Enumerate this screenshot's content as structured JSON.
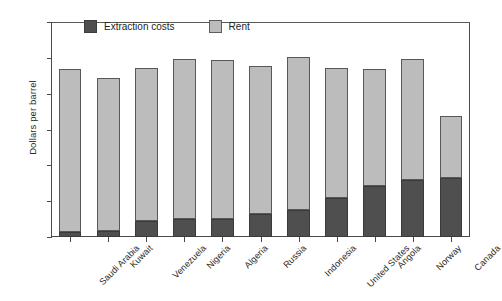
{
  "chart_data": {
    "type": "bar",
    "subtype": "stacked-vertical",
    "title": "",
    "xlabel": "",
    "ylabel": "Dollars per barrel",
    "ylim": [
      0,
      120
    ],
    "ytick_step": 20,
    "yticks": [
      0,
      20,
      40,
      60,
      80,
      100,
      120
    ],
    "ytick_labels": [
      "0",
      "20",
      "40",
      "60",
      "80",
      "100",
      "120"
    ],
    "grid": false,
    "legend_position": "top-inside",
    "categories": [
      "Saudi Arabia",
      "Kuwait",
      "Venezuela",
      "Nigeria",
      "Algeria",
      "Russia",
      "Indonesia",
      "United States",
      "Angola",
      "Norway",
      "Canada"
    ],
    "series": [
      {
        "name": "Extraction costs",
        "color": "#4f4f4f",
        "values": [
          3,
          3.5,
          9,
          10,
          10,
          13,
          15,
          22,
          28.5,
          32,
          33
        ]
      },
      {
        "name": "Rent",
        "color": "#bcbcbc",
        "values": [
          90,
          84.5,
          85,
          89,
          88,
          82,
          85,
          72,
          64.5,
          67,
          34
        ]
      }
    ],
    "totals": [
      93,
      88,
      94,
      99,
      98,
      95,
      100,
      94,
      93,
      99,
      67
    ]
  },
  "legend": {
    "items": [
      {
        "label": "Extraction costs",
        "swatch": "dark-square-swatch"
      },
      {
        "label": "Rent",
        "swatch": "light-square-swatch"
      }
    ]
  },
  "axes": {
    "y_title": "Dollars per barrel"
  }
}
